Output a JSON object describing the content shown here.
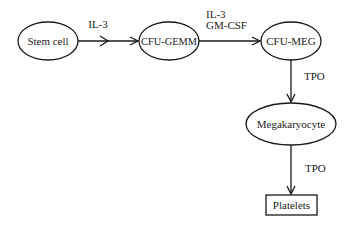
{
  "diagram": {
    "nodes": [
      {
        "id": "stem",
        "label": "Stem cell",
        "shape": "ellipse"
      },
      {
        "id": "gemm",
        "label": "CFU-GEMM",
        "shape": "ellipse"
      },
      {
        "id": "meg",
        "label": "CFU-MEG",
        "shape": "ellipse"
      },
      {
        "id": "mk",
        "label": "Megakaryocyte",
        "shape": "ellipse"
      },
      {
        "id": "plt",
        "label": "Platelets",
        "shape": "rectangle"
      }
    ],
    "edges": [
      {
        "from": "stem",
        "to": "gemm",
        "label_lines": [
          "IL-3"
        ]
      },
      {
        "from": "gemm",
        "to": "meg",
        "label_lines": [
          "IL-3",
          "GM-CSF"
        ]
      },
      {
        "from": "meg",
        "to": "mk",
        "label_lines": [
          "TPO"
        ]
      },
      {
        "from": "mk",
        "to": "plt",
        "label_lines": [
          "TPO"
        ]
      }
    ]
  },
  "colors": {
    "stroke": "#1a1a1a",
    "text": "#222222",
    "background": "#ffffff"
  }
}
